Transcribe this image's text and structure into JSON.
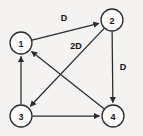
{
  "diagram": {
    "type": "directed-graph",
    "background_color": "#f4f3f1",
    "stroke_color": "#2b2b2b",
    "node_fill_color": "#fbfbfa",
    "nodes": [
      {
        "id": "1",
        "label": "1",
        "cx": 21,
        "cy": 43,
        "r": 11
      },
      {
        "id": "2",
        "label": "2",
        "cx": 112,
        "cy": 20,
        "r": 11
      },
      {
        "id": "3",
        "label": "3",
        "cx": 21,
        "cy": 116,
        "r": 11
      },
      {
        "id": "4",
        "label": "4",
        "cx": 113,
        "cy": 116,
        "r": 11
      }
    ],
    "edges": [
      {
        "id": "e1",
        "from": "1",
        "to": "2",
        "label": "D",
        "label_x": 64,
        "label_y": 18
      },
      {
        "id": "e2",
        "from": "2",
        "to": "4",
        "label": "D",
        "label_x": 123,
        "label_y": 67
      },
      {
        "id": "e3",
        "from": "4",
        "to": "1",
        "label": "2D",
        "label_x": 76,
        "label_y": 46
      },
      {
        "id": "e4",
        "from": "2",
        "to": "3",
        "label": "",
        "label_x": 0,
        "label_y": 0
      },
      {
        "id": "e5",
        "from": "3",
        "to": "1",
        "label": "",
        "label_x": 0,
        "label_y": 0
      },
      {
        "id": "e6",
        "from": "3",
        "to": "4",
        "label": "",
        "label_x": 0,
        "label_y": 0
      }
    ]
  }
}
